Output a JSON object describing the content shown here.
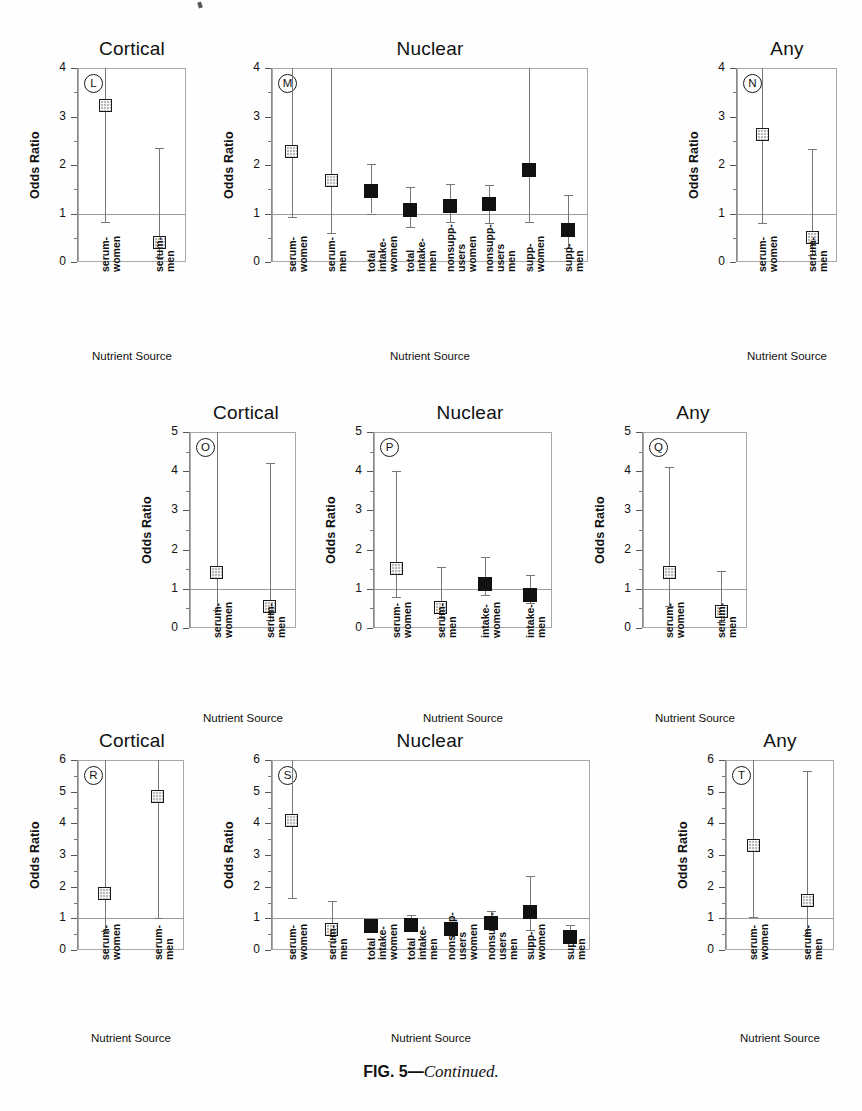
{
  "figure": {
    "caption_bold": "FIG. 5",
    "caption_dash": "—",
    "caption_italic": "Continued."
  },
  "common": {
    "y_axis_label": "Odds Ratio",
    "x_axis_label": "Nutrient Source",
    "reference_value": 1
  },
  "chart_data": [
    {
      "id": "L",
      "type": "scatter",
      "title": "Cortical",
      "panel_letter": "L",
      "xlabel": "Nutrient Source",
      "ylabel": "Odds Ratio",
      "ylim": [
        0,
        4
      ],
      "yticks": [
        0,
        1,
        2,
        3,
        4
      ],
      "reference_line": 1,
      "categories": [
        "serum-women",
        "serum-men"
      ],
      "category_lines": [
        [
          "serum-",
          "women"
        ],
        [
          "serum-",
          "men"
        ]
      ],
      "values": [
        3.22,
        0.4
      ],
      "ci_low": [
        0.82,
        0.1
      ],
      "ci_high": [
        4.0,
        2.35
      ],
      "ci_high_clipped": [
        true,
        false
      ],
      "marker_style": [
        "open",
        "open"
      ],
      "marker_size": [
        13,
        13
      ]
    },
    {
      "id": "M",
      "type": "scatter",
      "title": "Nuclear",
      "panel_letter": "M",
      "xlabel": "Nutrient Source",
      "ylabel": "Odds Ratio",
      "ylim": [
        0,
        4
      ],
      "yticks": [
        0,
        1,
        2,
        3,
        4
      ],
      "reference_line": 1,
      "categories": [
        "serum-women",
        "serum-men",
        "total intake-women",
        "total intake-men",
        "nonsupp users women",
        "nonsupp users men",
        "supp-women",
        "supp-men"
      ],
      "category_lines": [
        [
          "serum-",
          "women"
        ],
        [
          "serum-",
          "men"
        ],
        [
          "total",
          "intake-",
          "women"
        ],
        [
          "total",
          "intake-",
          "men"
        ],
        [
          "nonsupp-",
          "users",
          "women"
        ],
        [
          "nonsupp-",
          "users",
          "men"
        ],
        [
          "supp-",
          "women"
        ],
        [
          "supp-",
          "men"
        ]
      ],
      "values": [
        2.27,
        1.68,
        1.47,
        1.08,
        1.15,
        1.2,
        1.9,
        0.65
      ],
      "ci_low": [
        0.93,
        0.6,
        1.0,
        0.72,
        0.83,
        0.8,
        0.83,
        0.28
      ],
      "ci_high": [
        4.0,
        4.0,
        2.02,
        1.55,
        1.6,
        1.58,
        4.0,
        1.38
      ],
      "ci_high_clipped": [
        true,
        true,
        false,
        false,
        false,
        false,
        true,
        false
      ],
      "marker_style": [
        "open",
        "open",
        "filled",
        "filled",
        "filled",
        "filled",
        "filled",
        "filled"
      ],
      "marker_size": [
        13,
        13,
        14,
        14,
        14,
        14,
        14,
        14
      ]
    },
    {
      "id": "N",
      "type": "scatter",
      "title": "Any",
      "panel_letter": "N",
      "xlabel": "Nutrient Source",
      "ylabel": "Odds Ratio",
      "ylim": [
        0,
        4
      ],
      "yticks": [
        0,
        1,
        2,
        3,
        4
      ],
      "reference_line": 1,
      "categories": [
        "serum-women",
        "serum-men"
      ],
      "category_lines": [
        [
          "serum-",
          "women"
        ],
        [
          "serum-",
          "men"
        ]
      ],
      "values": [
        2.63,
        0.5
      ],
      "ci_low": [
        0.8,
        0.15
      ],
      "ci_high": [
        4.0,
        2.33
      ],
      "ci_high_clipped": [
        true,
        false
      ],
      "marker_style": [
        "open",
        "open"
      ],
      "marker_size": [
        13,
        13
      ]
    },
    {
      "id": "O",
      "type": "scatter",
      "title": "Cortical",
      "panel_letter": "O",
      "xlabel": "Nutrient Source",
      "ylabel": "Odds Ratio",
      "ylim": [
        0,
        5
      ],
      "yticks": [
        0,
        1,
        2,
        3,
        4,
        5
      ],
      "reference_line": 1,
      "categories": [
        "serum-women",
        "serum-men"
      ],
      "category_lines": [
        [
          "serum-",
          "women"
        ],
        [
          "serum-",
          "men"
        ]
      ],
      "values": [
        1.42,
        0.55
      ],
      "ci_low": [
        0.45,
        0.2
      ],
      "ci_high": [
        5.0,
        4.2
      ],
      "ci_high_clipped": [
        true,
        false
      ],
      "marker_style": [
        "open",
        "open"
      ],
      "marker_size": [
        13,
        13
      ]
    },
    {
      "id": "P",
      "type": "scatter",
      "title": "Nuclear",
      "panel_letter": "P",
      "xlabel": "Nutrient Source",
      "ylabel": "Odds Ratio",
      "ylim": [
        0,
        5
      ],
      "yticks": [
        0,
        1,
        2,
        3,
        4,
        5
      ],
      "reference_line": 1,
      "categories": [
        "serum-women",
        "serum-men",
        "intake-women",
        "intake-men"
      ],
      "category_lines": [
        [
          "serum-",
          "women"
        ],
        [
          "serum-",
          "men"
        ],
        [
          "intake-",
          "women"
        ],
        [
          "intake-",
          "men"
        ]
      ],
      "values": [
        1.52,
        0.52,
        1.12,
        0.85
      ],
      "ci_low": [
        0.8,
        0.25,
        0.85,
        0.65
      ],
      "ci_high": [
        4.0,
        1.55,
        1.8,
        1.35
      ],
      "ci_high_clipped": [
        false,
        false,
        false,
        false
      ],
      "marker_style": [
        "open",
        "open",
        "filled",
        "filled"
      ],
      "marker_size": [
        13,
        13,
        14,
        14
      ]
    },
    {
      "id": "Q",
      "type": "scatter",
      "title": "Any",
      "panel_letter": "Q",
      "xlabel": "Nutrient Source",
      "ylabel": "Odds Ratio",
      "ylim": [
        0,
        5
      ],
      "yticks": [
        0,
        1,
        2,
        3,
        4,
        5
      ],
      "reference_line": 1,
      "categories": [
        "serum-women",
        "serum-men"
      ],
      "category_lines": [
        [
          "serum-",
          "women"
        ],
        [
          "serum-",
          "men"
        ]
      ],
      "values": [
        1.42,
        0.42
      ],
      "ci_low": [
        0.55,
        0.15
      ],
      "ci_high": [
        4.1,
        1.45
      ],
      "ci_high_clipped": [
        false,
        false
      ],
      "marker_style": [
        "open",
        "open"
      ],
      "marker_size": [
        13,
        13
      ]
    },
    {
      "id": "R",
      "type": "scatter",
      "title": "Cortical",
      "panel_letter": "R",
      "xlabel": "Nutrient Source",
      "ylabel": "Odds Ratio",
      "ylim": [
        0,
        6
      ],
      "yticks": [
        0,
        1,
        2,
        3,
        4,
        5,
        6
      ],
      "reference_line": 1,
      "categories": [
        "serum-women",
        "serum-men"
      ],
      "category_lines": [
        [
          "serum-",
          "women"
        ],
        [
          "serum-",
          "men"
        ]
      ],
      "values": [
        1.78,
        4.85
      ],
      "ci_low": [
        0.6,
        1.0
      ],
      "ci_high": [
        6.0,
        6.0
      ],
      "ci_high_clipped": [
        true,
        true
      ],
      "marker_style": [
        "open",
        "open"
      ],
      "marker_size": [
        13,
        13
      ]
    },
    {
      "id": "S",
      "type": "scatter",
      "title": "Nuclear",
      "panel_letter": "S",
      "xlabel": "Nutrient Source",
      "ylabel": "Odds Ratio",
      "ylim": [
        0,
        6
      ],
      "yticks": [
        0,
        1,
        2,
        3,
        4,
        5,
        6
      ],
      "reference_line": 1,
      "categories": [
        "serum-women",
        "serum-men",
        "total intake-women",
        "total intake-men",
        "nonsupp users women",
        "nonsupp users men",
        "supp-women",
        "supp-men"
      ],
      "category_lines": [
        [
          "serum-",
          "women"
        ],
        [
          "serum-",
          "men"
        ],
        [
          "total",
          "intake-",
          "women"
        ],
        [
          "total",
          "intake-",
          "men"
        ],
        [
          "nonsupp-",
          "users",
          "women"
        ],
        [
          "nonsupp-",
          "users",
          "men"
        ],
        [
          "supp-",
          "women"
        ],
        [
          "supp-",
          "men"
        ]
      ],
      "values": [
        4.1,
        0.65,
        0.75,
        0.8,
        0.65,
        0.85,
        1.2,
        0.4
      ],
      "ci_low": [
        1.65,
        0.3,
        0.62,
        0.62,
        0.55,
        0.65,
        0.62,
        0.22
      ],
      "ci_high": [
        6.0,
        1.55,
        0.92,
        1.1,
        0.8,
        1.22,
        2.35,
        0.78
      ],
      "ci_high_clipped": [
        true,
        false,
        false,
        false,
        false,
        false,
        false,
        false
      ],
      "marker_style": [
        "open",
        "open",
        "filled",
        "filled",
        "filled",
        "filled",
        "filled",
        "filled"
      ],
      "marker_size": [
        13,
        13,
        14,
        14,
        14,
        14,
        14,
        14
      ]
    },
    {
      "id": "T",
      "type": "scatter",
      "title": "Any",
      "panel_letter": "T",
      "xlabel": "Nutrient Source",
      "ylabel": "Odds Ratio",
      "ylim": [
        0,
        6
      ],
      "yticks": [
        0,
        1,
        2,
        3,
        4,
        5,
        6
      ],
      "reference_line": 1,
      "categories": [
        "serum-women",
        "serum-men"
      ],
      "category_lines": [
        [
          "serum-",
          "women"
        ],
        [
          "serum-",
          "men"
        ]
      ],
      "values": [
        3.3,
        1.55
      ],
      "ci_low": [
        1.05,
        0.48
      ],
      "ci_high": [
        6.0,
        5.65
      ],
      "ci_high_clipped": [
        true,
        false
      ],
      "marker_style": [
        "open",
        "open"
      ],
      "marker_size": [
        13,
        13
      ]
    }
  ],
  "layout": {
    "panels": [
      {
        "id": "L",
        "box_x": 78,
        "box_y": 68,
        "box_w": 108,
        "box_h": 194,
        "title_x": 62,
        "title_y": 38,
        "title_w": 140,
        "label_band_y": 272,
        "xaxis_title_y": 350
      },
      {
        "id": "M",
        "box_x": 272,
        "box_y": 68,
        "box_w": 316,
        "box_h": 194,
        "title_x": 350,
        "title_y": 38,
        "title_w": 160,
        "label_band_y": 272,
        "xaxis_title_y": 350
      },
      {
        "id": "N",
        "box_x": 737,
        "box_y": 68,
        "box_w": 100,
        "box_h": 194,
        "title_x": 722,
        "title_y": 38,
        "title_w": 130,
        "label_band_y": 272,
        "xaxis_title_y": 350
      },
      {
        "id": "O",
        "box_x": 190,
        "box_y": 432,
        "box_w": 106,
        "box_h": 196,
        "title_x": 176,
        "title_y": 402,
        "title_w": 140,
        "label_band_y": 638,
        "xaxis_title_y": 712
      },
      {
        "id": "P",
        "box_x": 374,
        "box_y": 432,
        "box_w": 178,
        "box_h": 196,
        "title_x": 390,
        "title_y": 402,
        "title_w": 160,
        "label_band_y": 638,
        "xaxis_title_y": 712
      },
      {
        "id": "Q",
        "box_x": 643,
        "box_y": 432,
        "box_w": 104,
        "box_h": 196,
        "title_x": 628,
        "title_y": 402,
        "title_w": 130,
        "label_band_y": 638,
        "xaxis_title_y": 712
      },
      {
        "id": "R",
        "box_x": 78,
        "box_y": 760,
        "box_w": 106,
        "box_h": 190,
        "title_x": 62,
        "title_y": 730,
        "title_w": 140,
        "label_band_y": 960,
        "xaxis_title_y": 1032
      },
      {
        "id": "S",
        "box_x": 272,
        "box_y": 760,
        "box_w": 318,
        "box_h": 190,
        "title_x": 350,
        "title_y": 730,
        "title_w": 160,
        "label_band_y": 960,
        "xaxis_title_y": 1032
      },
      {
        "id": "T",
        "box_x": 726,
        "box_y": 760,
        "box_w": 108,
        "box_h": 190,
        "title_x": 710,
        "title_y": 730,
        "title_w": 140,
        "label_band_y": 960,
        "xaxis_title_y": 1032
      }
    ]
  },
  "colors": {
    "marker_open_fill": "#b9b9b9",
    "marker_filled": "#111111",
    "axis": "#8a8a8a",
    "reference_line": "#9a9a9a",
    "text": "#111111"
  }
}
